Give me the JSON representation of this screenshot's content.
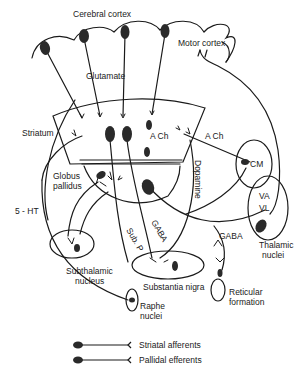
{
  "diagram": {
    "type": "basal-ganglia-circuitry",
    "labels": {
      "cerebral_cortex": "Cerebral cortex",
      "motor_cortex": "Motor cortex",
      "glutamate": "Glutamate",
      "striatum": "Striatum",
      "ach_1": "A Ch",
      "ach_2": "A Ch",
      "globus_pallidus_1": "Globus",
      "globus_pallidus_2": "pallidus",
      "five_ht": "5 - HT",
      "dopamine": "Dopamine",
      "gaba_1": "GABA",
      "sub_p": "Sub. P",
      "gaba_2": "GABA",
      "cm": "CM",
      "va": "VA",
      "vl": "VL",
      "thalamic_1": "Thalamic",
      "thalamic_2": "nuclei",
      "subthalamic_1": "Subthalamic",
      "subthalamic_2": "nucleus",
      "substantia_nigra": "Substantia nigra",
      "reticular_1": "Reticular",
      "reticular_2": "formation",
      "raphe_1": "Raphe",
      "raphe_2": "nuclei"
    },
    "legend": [
      {
        "label": "Striatal afferents"
      },
      {
        "label": "Pallidal efferents"
      }
    ],
    "colors": {
      "ink": "#1a1a1a",
      "neuron": "#2a2a2a",
      "background": "#ffffff"
    }
  }
}
